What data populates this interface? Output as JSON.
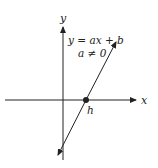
{
  "diagram": {
    "equation": "y = ax + b",
    "condition": "a ≠ 0",
    "x_axis_label": "x",
    "y_axis_label": "y",
    "intercept_label": "h",
    "colors": {
      "stroke": "#222222",
      "background": "#ffffff"
    }
  }
}
